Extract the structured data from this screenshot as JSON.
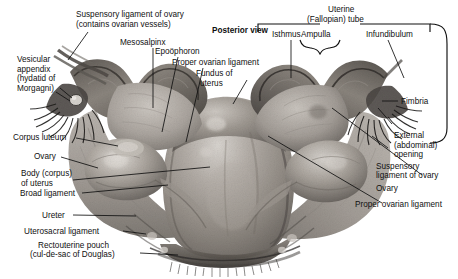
{
  "figure": {
    "title": "Posterior view",
    "background_color": "#ffffff",
    "text_color": "#101010",
    "leader_color": "#111111",
    "width": 458,
    "height": 279
  },
  "labels": {
    "posterior_view": "Posterior view",
    "suspensory_ligament_ovary_l1": "Suspensory ligament of ovary",
    "suspensory_ligament_ovary_l2": "(contains ovarian vessels)",
    "mesosalpinx": "Mesosalpinx",
    "vesicular_appendix_l1": "Vesicular",
    "vesicular_appendix_l2": "appendix",
    "vesicular_appendix_l3": "(hydatid of",
    "vesicular_appendix_l4": "Morgagni)",
    "epoophoron": "Epoöphoron",
    "proper_ovarian_ligament_left": "Proper ovarian ligament",
    "fundus_of_uterus_l1": "Fundus of",
    "fundus_of_uterus_l2": "uterus",
    "corpus_luteum": "Corpus luteum",
    "ovary_left": "Ovary",
    "body_of_uterus_l1": "Body (corpus)",
    "body_of_uterus_l2": "of uterus",
    "broad_ligament": "Broad ligament",
    "ureter": "Ureter",
    "uterosacral_ligament": "Uterosacral ligament",
    "rectouterine_pouch_l1": "Rectouterine pouch",
    "rectouterine_pouch_l2": "(cul-de-sac of Douglas)",
    "uterine_tube_l1": "Uterine",
    "uterine_tube_l2": "(Fallopian) tube",
    "isthmus": "Isthmus",
    "ampulla": "Ampulla",
    "infundibulum": "Infundibulum",
    "fimbria": "Fimbria",
    "external_opening_l1": "External",
    "external_opening_l2": "(abdominal)",
    "external_opening_l3": "opening",
    "suspensory_ligament_right_l1": "Suspensory",
    "suspensory_ligament_right_l2": "ligament of ovary",
    "ovary_right": "Ovary",
    "proper_ovarian_ligament_right": "Proper ovarian ligament"
  }
}
